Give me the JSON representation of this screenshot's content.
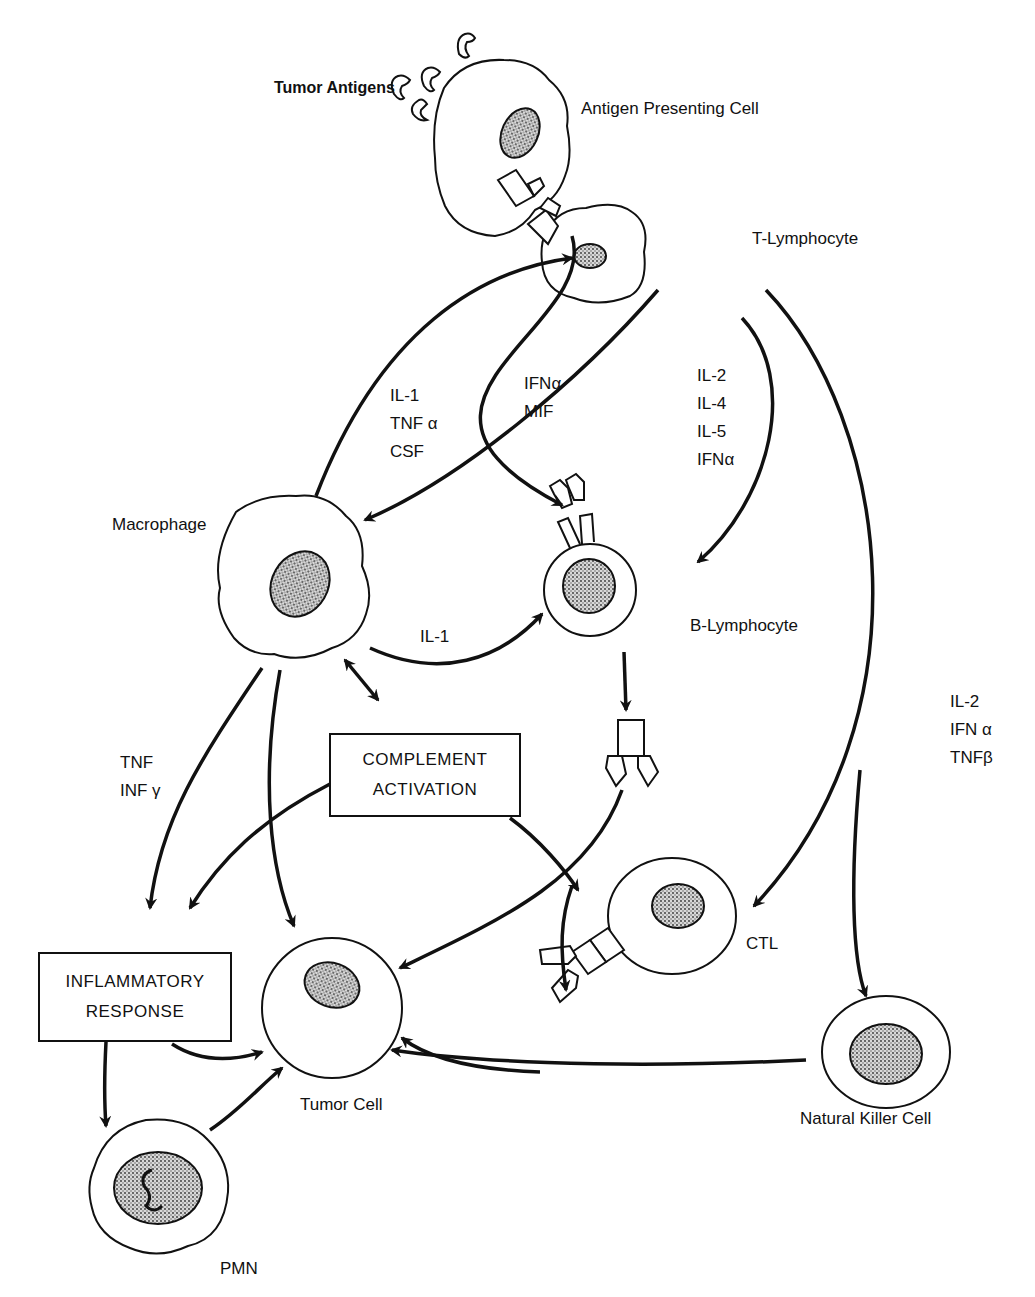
{
  "cells": {
    "tumor_antigens": "Tumor Antigens",
    "apc": "Antigen Presenting Cell",
    "t_lymphocyte": "T-Lymphocyte",
    "macrophage": "Macrophage",
    "b_lymphocyte": "B-Lymphocyte",
    "tumor_cell": "Tumor Cell",
    "ctl": "CTL",
    "nk_cell": "Natural Killer Cell",
    "pmn": "PMN"
  },
  "boxes": {
    "complement": [
      "COMPLEMENT",
      "ACTIVATION"
    ],
    "inflammatory": [
      "INFLAMMATORY",
      "RESPONSE"
    ]
  },
  "cytokines": {
    "macrophage_to_t": [
      "IL-1",
      "TNF α",
      "CSF"
    ],
    "t_to_macrophage": [
      "IFNα",
      "MIF"
    ],
    "t_to_b": [
      "IL-2",
      "IL-4",
      "IL-5",
      "IFNα"
    ],
    "macrophage_to_b": [
      "IL-1"
    ],
    "macrophage_to_inflammatory": [
      "TNF",
      "INF γ"
    ],
    "t_to_ctl_nk": [
      "IL-2",
      "IFN α",
      "TNFβ"
    ]
  },
  "colors": {
    "ink": "#111111",
    "background": "#ffffff"
  }
}
